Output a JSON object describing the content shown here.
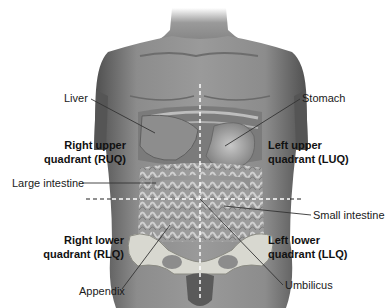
{
  "diagram": {
    "type": "anatomical-illustration",
    "colors": {
      "background": "#ffffff",
      "skin": "#8a8a8a",
      "skin_dark": "#5e5e5e",
      "skin_light": "#b5b5b5",
      "organ": "#a9a9a9",
      "bone": "#d8d8d0",
      "dashed_line": "#ffffff",
      "outer_dashed_line": "#222222",
      "leader_line": "#333333",
      "text": "#1a1a1a"
    }
  },
  "quadrants": {
    "ruq": {
      "line1": "Right upper",
      "line2": "quadrant (RUQ)"
    },
    "luq": {
      "line1": "Left upper",
      "line2": "quadrant (LUQ)"
    },
    "rlq": {
      "line1": "Right lower",
      "line2": "quadrant (RLQ)"
    },
    "llq": {
      "line1": "Left lower",
      "line2": "quadrant (LLQ)"
    }
  },
  "labels": {
    "liver": "Liver",
    "stomach": "Stomach",
    "large_intestine": "Large intestine",
    "small_intestine": "Small intestine",
    "appendix": "Appendix",
    "umbilicus": "Umbilicus"
  }
}
